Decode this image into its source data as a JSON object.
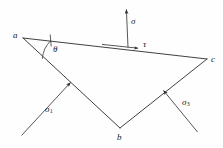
{
  "figure": {
    "type": "stress-element-diagram",
    "stroke_color": "#2b2b2b",
    "text_color": "#1a1a1a",
    "background_color": "#fefefe"
  },
  "vertices": [
    {
      "id": "a",
      "label": "a",
      "x": 23,
      "y": 38,
      "label_x": 13,
      "label_y": 31
    },
    {
      "id": "b",
      "label": "b",
      "x": 120,
      "y": 128,
      "label_x": 117,
      "label_y": 133
    },
    {
      "id": "c",
      "label": "c",
      "x": 207,
      "y": 59,
      "label_x": 211,
      "label_y": 55
    }
  ],
  "edges": [
    {
      "id": "ac",
      "from": "a",
      "to": "c",
      "x1": 23,
      "y1": 38,
      "x2": 207,
      "y2": 59
    },
    {
      "id": "ab",
      "from": "a",
      "to": "b",
      "x1": 23,
      "y1": 38,
      "x2": 120,
      "y2": 128
    },
    {
      "id": "bc",
      "from": "b",
      "to": "c",
      "x1": 120,
      "y1": 128,
      "x2": 207,
      "y2": 59
    }
  ],
  "stresses": [
    {
      "id": "sigma-normal",
      "label": "σ",
      "subscript": "",
      "label_x": 131,
      "label_y": 17,
      "line": {
        "x1": 128,
        "y1": 47,
        "x2": 126,
        "y2": 8
      },
      "arrow_at": "head",
      "direction": "up"
    },
    {
      "id": "tau-shear",
      "label": "τ",
      "subscript": "",
      "label_x": 143,
      "label_y": 40,
      "line": {
        "x1": 103,
        "y1": 45,
        "x2": 139,
        "y2": 48
      },
      "arrow_at": "head",
      "direction": "right-along-ac"
    },
    {
      "id": "sigma-1",
      "label": "σ",
      "subscript": "1",
      "label_x": 45,
      "label_y": 105,
      "line": {
        "x1": 22,
        "y1": 135,
        "x2": 71,
        "y2": 82
      },
      "arrow_at": "head",
      "direction": "up-right-onto-ab"
    },
    {
      "id": "sigma-3",
      "label": "σ",
      "subscript": "3",
      "label_x": 182,
      "label_y": 98,
      "line": {
        "x1": 197,
        "y1": 132,
        "x2": 163,
        "y2": 90
      },
      "arrow_at": "head",
      "direction": "up-left-onto-bc"
    }
  ],
  "angle": {
    "id": "theta",
    "label": "θ",
    "label_x": 53,
    "label_y": 45,
    "vertex": "a",
    "arc": {
      "cx": 23,
      "cy": 38,
      "r": 29
    },
    "tick_mark": {
      "x1": 49,
      "y1": 36,
      "x2": 51,
      "y2": 46
    }
  }
}
